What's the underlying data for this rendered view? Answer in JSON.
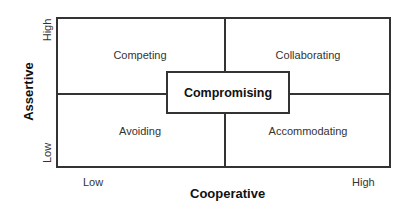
{
  "diagram": {
    "center": "Compromising",
    "quadrants": {
      "top_left": "Competing",
      "top_right": "Collaborating",
      "bottom_left": "Avoiding",
      "bottom_right": "Accommodating"
    },
    "x_axis": {
      "title": "Cooperative",
      "low": "Low",
      "high": "High"
    },
    "y_axis": {
      "title": "Assertive",
      "low": "Low",
      "high": "High"
    },
    "colors": {
      "line": "#333333",
      "text": "#222222",
      "background": "#ffffff"
    }
  }
}
